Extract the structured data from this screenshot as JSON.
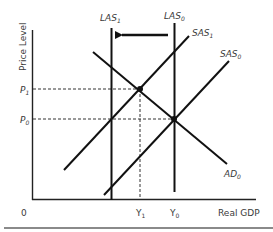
{
  "diagram": {
    "type": "AS-AD model",
    "axes": {
      "y_label": "Price Level",
      "x_label": "Real GDP",
      "origin": "0"
    },
    "price_levels": [
      {
        "name": "P1",
        "base": "P",
        "sub": "1"
      },
      {
        "name": "P0",
        "base": "P",
        "sub": "0"
      }
    ],
    "output_levels": [
      {
        "name": "Y1",
        "base": "Y",
        "sub": "1"
      },
      {
        "name": "Y0",
        "base": "Y",
        "sub": "0"
      }
    ],
    "curves": {
      "las1": {
        "base": "LAS",
        "sub": "1"
      },
      "las0": {
        "base": "LAS",
        "sub": "0"
      },
      "sas1": {
        "base": "SAS",
        "sub": "1"
      },
      "sas0": {
        "base": "SAS",
        "sub": "0"
      },
      "ad0": {
        "base": "AD",
        "sub": "0"
      }
    },
    "arrow": "LAS shifts left from LAS0 to LAS1",
    "colors": {
      "line": "#111111",
      "text": "#3a3a3a",
      "rule": "#8a8a8a"
    }
  }
}
